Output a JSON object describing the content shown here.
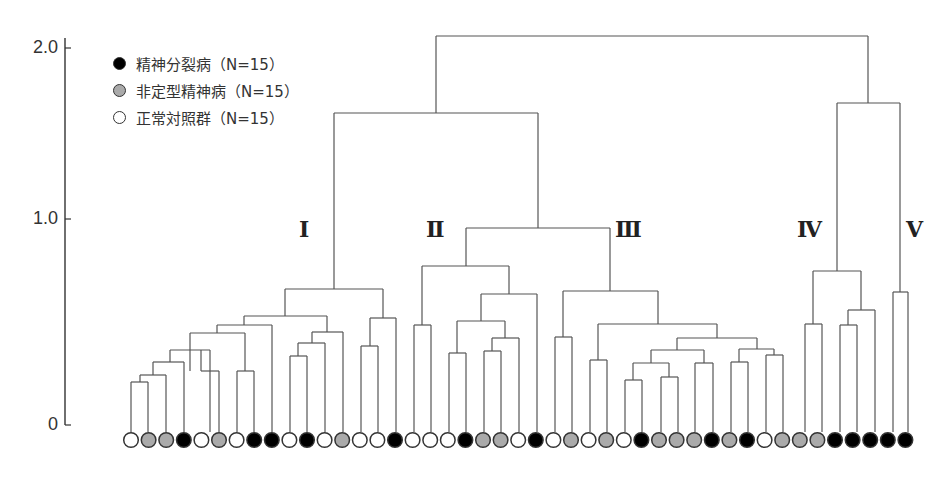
{
  "chart_data": {
    "type": "dendrogram",
    "title": "",
    "ylabel": "",
    "ylim": [
      0,
      2.0
    ],
    "yticks": [
      {
        "label": "2.0",
        "value": 2.0
      },
      {
        "label": "1.0",
        "value": 1.0
      },
      {
        "label": "0",
        "value": 0
      }
    ],
    "legend": [
      {
        "label": "精神分裂病（N=15）",
        "class": "S",
        "fill": "#000000"
      },
      {
        "label": "非定型精神病（N=15）",
        "class": "A",
        "fill": "#aaaaaa"
      },
      {
        "label": "正常対照群（N=15）",
        "class": "N",
        "fill": "#ffffff"
      }
    ],
    "cluster_labels": [
      {
        "label": "Ⅰ",
        "x": 308,
        "y": 230
      },
      {
        "label": "Ⅱ",
        "x": 435,
        "y": 230
      },
      {
        "label": "Ⅲ",
        "x": 624,
        "y": 230
      },
      {
        "label": "Ⅳ",
        "x": 806,
        "y": 230
      },
      {
        "label": "Ⅴ",
        "x": 915,
        "y": 230
      }
    ],
    "leaves": [
      "N",
      "A",
      "A",
      "S",
      "N",
      "A",
      "N",
      "S",
      "S",
      "N",
      "S",
      "N",
      "A",
      "N",
      "N",
      "S",
      "N",
      "N",
      "N",
      "S",
      "A",
      "A",
      "N",
      "S",
      "N",
      "A",
      "N",
      "A",
      "N",
      "S",
      "A",
      "A",
      "A",
      "S",
      "A",
      "S",
      "N",
      "A",
      "A",
      "A",
      "S",
      "S",
      "S",
      "S",
      "S"
    ],
    "merges_px": [
      {
        "l": 131,
        "r": 148,
        "y": 382
      },
      {
        "l": 140,
        "r": 166,
        "y": 375
      },
      {
        "l": 153,
        "r": 184,
        "y": 362
      },
      {
        "l": 170,
        "r": 210,
        "y": 350
      },
      {
        "l": 201,
        "r": 219,
        "y": 371
      },
      {
        "l": 237,
        "r": 254,
        "y": 371
      },
      {
        "l": 190,
        "r": 245,
        "y": 333
      },
      {
        "l": 217,
        "r": 272,
        "y": 325
      },
      {
        "l": 290,
        "r": 307,
        "y": 356
      },
      {
        "l": 298,
        "r": 325,
        "y": 343
      },
      {
        "l": 312,
        "r": 343,
        "y": 332
      },
      {
        "l": 244,
        "r": 327,
        "y": 316
      },
      {
        "l": 361,
        "r": 378,
        "y": 346
      },
      {
        "l": 370,
        "r": 396,
        "y": 318
      },
      {
        "l": 285,
        "r": 383,
        "y": 289
      },
      {
        "l": 414,
        "r": 431,
        "y": 325
      },
      {
        "l": 449,
        "r": 466,
        "y": 353
      },
      {
        "l": 484,
        "r": 501,
        "y": 351
      },
      {
        "l": 492,
        "r": 519,
        "y": 338
      },
      {
        "l": 457,
        "r": 505,
        "y": 321
      },
      {
        "l": 481,
        "r": 537,
        "y": 294
      },
      {
        "l": 422,
        "r": 509,
        "y": 266
      },
      {
        "l": 555,
        "r": 572,
        "y": 337
      },
      {
        "l": 590,
        "r": 607,
        "y": 360
      },
      {
        "l": 625,
        "r": 642,
        "y": 380
      },
      {
        "l": 661,
        "r": 678,
        "y": 377
      },
      {
        "l": 633,
        "r": 669,
        "y": 363
      },
      {
        "l": 695,
        "r": 713,
        "y": 363
      },
      {
        "l": 651,
        "r": 704,
        "y": 350
      },
      {
        "l": 731,
        "r": 748,
        "y": 362
      },
      {
        "l": 766,
        "r": 783,
        "y": 355
      },
      {
        "l": 739,
        "r": 774,
        "y": 349
      },
      {
        "l": 677,
        "r": 757,
        "y": 338
      },
      {
        "l": 598,
        "r": 717,
        "y": 324
      },
      {
        "l": 563,
        "r": 658,
        "y": 291
      },
      {
        "l": 466,
        "r": 610,
        "y": 228
      },
      {
        "l": 334,
        "r": 538,
        "y": 113
      },
      {
        "l": 805,
        "r": 822,
        "y": 324
      },
      {
        "l": 840,
        "r": 857,
        "y": 325
      },
      {
        "l": 848,
        "r": 875,
        "y": 310
      },
      {
        "l": 813,
        "r": 861,
        "y": 271
      },
      {
        "l": 893,
        "r": 908,
        "y": 292
      },
      {
        "l": 837,
        "r": 900,
        "y": 103
      },
      {
        "l": 436,
        "r": 868,
        "y": 36
      }
    ],
    "leaf_x0": 131,
    "leaf_dx": 17.6,
    "baseline_y": 425,
    "leaf_top_y": 432
  }
}
